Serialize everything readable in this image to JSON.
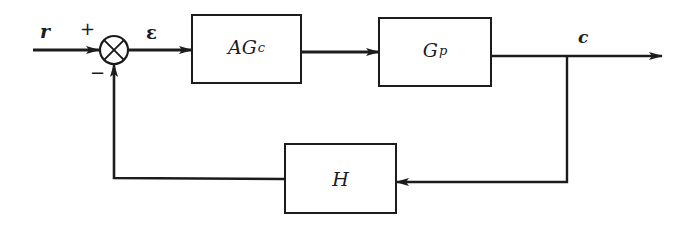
{
  "diagram": {
    "type": "feedback-control-block-diagram",
    "colors": {
      "line": "#1c1c1c",
      "background": "#ffffff"
    },
    "signals": {
      "reference": "r",
      "error": "ε",
      "output": "c"
    },
    "summing_junction": {
      "plus_sign": "+",
      "minus_sign": "−"
    },
    "blocks": [
      {
        "id": "controller",
        "main": "AG",
        "sub": "c"
      },
      {
        "id": "plant",
        "main": "G",
        "sub": "p"
      },
      {
        "id": "feedback",
        "main": "H",
        "sub": ""
      }
    ],
    "connections": [
      {
        "from": "r",
        "to": "summing_junction",
        "sign": "+"
      },
      {
        "from": "summing_junction",
        "to": "controller",
        "signal": "ε"
      },
      {
        "from": "controller",
        "to": "plant"
      },
      {
        "from": "plant",
        "to": "c"
      },
      {
        "from": "c",
        "to": "feedback"
      },
      {
        "from": "feedback",
        "to": "summing_junction",
        "sign": "−"
      }
    ]
  }
}
